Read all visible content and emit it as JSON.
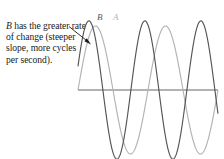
{
  "figure": {
    "annotation": {
      "emphasis": "B",
      "text": " has the greater rate of change (steeper slope, more cycles per second).",
      "full_text": "B has the greater rate of change (steeper slope, more cycles per second)."
    },
    "labels": {
      "curve_b": "B",
      "curve_a": "A"
    },
    "colors": {
      "curve_b": "#555555",
      "curve_a": "#b3b3b3",
      "axis": "#555555",
      "text": "#1a1a1a",
      "background": "#ffffff"
    }
  },
  "chart_data": {
    "type": "line",
    "title": "",
    "xlabel": "",
    "ylabel": "",
    "grid": false,
    "legend": "inline-curve-labels",
    "axis": {
      "x_start_px": 78,
      "x_end_px": 218,
      "baseline_y_px": 90,
      "xlim": [
        0,
        1
      ],
      "ylim": [
        -1.15,
        1.15
      ]
    },
    "annotations": [
      {
        "text": "B has the greater rate of change (steeper slope, more cycles per second).",
        "arrow_from": [
          70,
          27
        ],
        "arrow_to": [
          91,
          44
        ]
      }
    ],
    "series": [
      {
        "name": "A",
        "color": "#b3b3b3",
        "waveform": "sine",
        "amplitude": 1.0,
        "cycles": 2,
        "phase_deg": 0,
        "relative_rate_of_change": "lower",
        "peaks_x_px": [
          113,
          183
        ],
        "troughs_x_px": [
          148,
          214
        ]
      },
      {
        "name": "B",
        "color": "#555555",
        "waveform": "sine",
        "amplitude": 1.08,
        "cycles": 2.5,
        "phase_deg": 20,
        "relative_rate_of_change": "higher",
        "peaks_x_px": [
          99,
          162
        ],
        "troughs_x_px": [
          130,
          194
        ]
      }
    ]
  }
}
